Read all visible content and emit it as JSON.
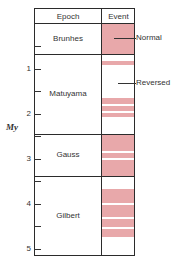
{
  "headers": {
    "epoch": "Epoch",
    "event": "Event"
  },
  "axis": {
    "unit": "My",
    "ticks": [
      {
        "label": "",
        "y": 46
      },
      {
        "label": "1",
        "y": 69
      },
      {
        "label": "",
        "y": 91
      },
      {
        "label": "2",
        "y": 114
      },
      {
        "label": "",
        "y": 136
      },
      {
        "label": "3",
        "y": 159
      },
      {
        "label": "",
        "y": 181
      },
      {
        "label": "4",
        "y": 204
      },
      {
        "label": "",
        "y": 226
      },
      {
        "label": "5",
        "y": 249
      }
    ]
  },
  "epochs": [
    {
      "name": "Brunhes",
      "top": 23,
      "bottom": 54
    },
    {
      "name": "Matuyama",
      "top": 54,
      "bottom": 134
    },
    {
      "name": "Gauss",
      "top": 134,
      "bottom": 176
    },
    {
      "name": "Gilbert",
      "top": 176,
      "bottom": 256
    }
  ],
  "normal_stripes": [
    {
      "top": 24,
      "bottom": 54
    },
    {
      "top": 61,
      "bottom": 65
    },
    {
      "top": 98,
      "bottom": 104
    },
    {
      "top": 106,
      "bottom": 111
    },
    {
      "top": 113,
      "bottom": 117
    },
    {
      "top": 134,
      "bottom": 151
    },
    {
      "top": 153,
      "bottom": 158
    },
    {
      "top": 160,
      "bottom": 176
    },
    {
      "top": 189,
      "bottom": 203
    },
    {
      "top": 205,
      "bottom": 217
    },
    {
      "top": 219,
      "bottom": 227
    },
    {
      "top": 229,
      "bottom": 237
    }
  ],
  "annotations": {
    "normal": "Normal",
    "reversed": "Reversed"
  },
  "colors": {
    "normal": "#e8a8aa",
    "reversed": "#ffffff",
    "line": "#2b2b2b"
  }
}
